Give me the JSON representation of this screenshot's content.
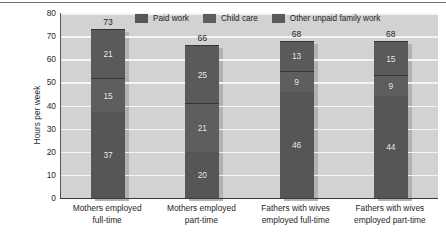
{
  "chart_data": {
    "type": "bar",
    "subtype": "stacked-bar",
    "title": "",
    "xlabel": "",
    "ylabel": "Hours per week",
    "ylim": [
      0,
      80
    ],
    "yticks": [
      80,
      70,
      60,
      50,
      40,
      30,
      20,
      10,
      0
    ],
    "grid": true,
    "legend_position": "top-center",
    "categories": [
      "Mothers employed full-time",
      "Mothers employed part-time",
      "Fathers with wives employed full-time",
      "Fathers with wives employed part-time"
    ],
    "category_lines": [
      [
        "Mothers employed",
        "full-time"
      ],
      [
        "Mothers employed",
        "part-time"
      ],
      [
        "Fathers with wives",
        "employed full-time"
      ],
      [
        "Fathers with wives",
        "employed part-time"
      ]
    ],
    "series": [
      {
        "name": "Paid work",
        "color": "#565656",
        "values": [
          37,
          20,
          46,
          44
        ]
      },
      {
        "name": "Child care",
        "color": "#5e5e5e",
        "values": [
          15,
          21,
          9,
          9
        ]
      },
      {
        "name": "Other unpaid family work",
        "color": "#5a5a5a",
        "values": [
          21,
          25,
          13,
          15
        ]
      }
    ],
    "totals": [
      73,
      66,
      68,
      68
    ]
  },
  "colors": {
    "plot_background": "#d2d2d2",
    "gridline": "#f4f4f4",
    "axis": "#3a3a3a",
    "bar_shadow": "#b2b2b2",
    "label_text": "#1f1f1f",
    "segment_text": "#f2f2f2"
  }
}
